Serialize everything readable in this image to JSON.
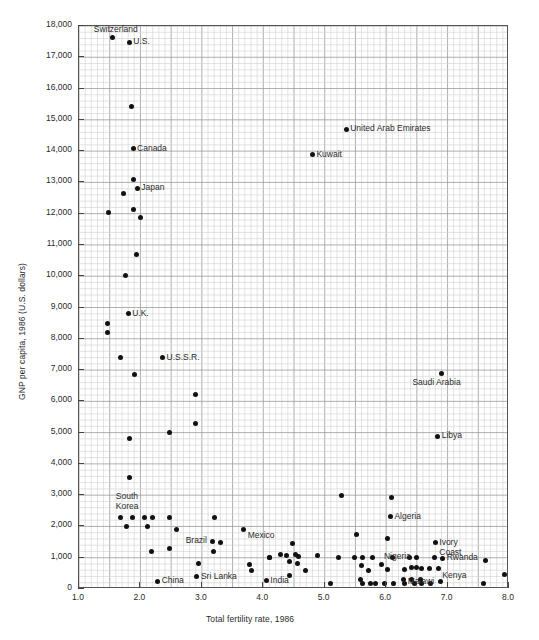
{
  "chart_data": {
    "type": "scatter",
    "title": "",
    "xlabel": "Total fertility rate, 1986",
    "ylabel": "GNP per capita, 1986 (U.S. dollars)",
    "xlim": [
      1.0,
      8.0
    ],
    "ylim": [
      0,
      18000
    ],
    "grid": true,
    "legend": "none",
    "xticks": [
      "1.0",
      "2.0",
      "3.0",
      "4.0",
      "5.0",
      "6.0",
      "7.0",
      "8.0"
    ],
    "xtick_values": [
      1.0,
      2.0,
      3.0,
      4.0,
      5.0,
      6.0,
      7.0,
      8.0
    ],
    "yticks": [
      "0",
      "1,000",
      "2,000",
      "3,000",
      "4,000",
      "5,000",
      "6,000",
      "7,000",
      "8,000",
      "9,000",
      "10,000",
      "11,000",
      "12,000",
      "13,000",
      "14,000",
      "15,000",
      "16,000",
      "17,000",
      "18,000"
    ],
    "ytick_values": [
      0,
      1000,
      2000,
      3000,
      4000,
      5000,
      6000,
      7000,
      8000,
      9000,
      10000,
      11000,
      12000,
      13000,
      14000,
      15000,
      16000,
      17000,
      18000
    ],
    "points": [
      {
        "x": 1.55,
        "y": 17620,
        "label": "Switzerland",
        "label_pos": "above-left"
      },
      {
        "x": 1.82,
        "y": 17480,
        "label": "U.S.",
        "label_pos": "right"
      },
      {
        "x": 1.86,
        "y": 15420,
        "label": "",
        "label_pos": ""
      },
      {
        "x": 1.88,
        "y": 14080,
        "label": "Canada",
        "label_pos": "right"
      },
      {
        "x": 1.88,
        "y": 13100,
        "label": "",
        "label_pos": ""
      },
      {
        "x": 1.73,
        "y": 12640,
        "label": "",
        "label_pos": ""
      },
      {
        "x": 1.95,
        "y": 12810,
        "label": "Japan",
        "label_pos": "right"
      },
      {
        "x": 1.88,
        "y": 12130,
        "label": "",
        "label_pos": ""
      },
      {
        "x": 1.48,
        "y": 12030,
        "label": "",
        "label_pos": ""
      },
      {
        "x": 2.0,
        "y": 11880,
        "label": "",
        "label_pos": ""
      },
      {
        "x": 1.93,
        "y": 10680,
        "label": "",
        "label_pos": ""
      },
      {
        "x": 1.75,
        "y": 10020,
        "label": "",
        "label_pos": ""
      },
      {
        "x": 1.8,
        "y": 8800,
        "label": "U.K.",
        "label_pos": "right"
      },
      {
        "x": 1.46,
        "y": 8490,
        "label": "",
        "label_pos": ""
      },
      {
        "x": 1.46,
        "y": 8200,
        "label": "",
        "label_pos": ""
      },
      {
        "x": 1.68,
        "y": 7390,
        "label": "",
        "label_pos": ""
      },
      {
        "x": 2.36,
        "y": 7390,
        "label": "U.S.S.R.",
        "label_pos": "right"
      },
      {
        "x": 1.9,
        "y": 6870,
        "label": "",
        "label_pos": ""
      },
      {
        "x": 2.9,
        "y": 6220,
        "label": "",
        "label_pos": ""
      },
      {
        "x": 2.9,
        "y": 5280,
        "label": "",
        "label_pos": ""
      },
      {
        "x": 2.48,
        "y": 5010,
        "label": "",
        "label_pos": ""
      },
      {
        "x": 1.82,
        "y": 4800,
        "label": "",
        "label_pos": ""
      },
      {
        "x": 6.9,
        "y": 6900,
        "label": "Saudi Arabia",
        "label_pos": "below"
      },
      {
        "x": 6.84,
        "y": 4880,
        "label": "Libya",
        "label_pos": "right"
      },
      {
        "x": 5.35,
        "y": 14700,
        "label": "United Arab Emirates",
        "label_pos": "right"
      },
      {
        "x": 4.8,
        "y": 13880,
        "label": "Kuwait",
        "label_pos": "right"
      },
      {
        "x": 1.83,
        "y": 3580,
        "label": "",
        "label_pos": ""
      },
      {
        "x": 5.28,
        "y": 2990,
        "label": "",
        "label_pos": ""
      },
      {
        "x": 6.08,
        "y": 2930,
        "label": "",
        "label_pos": ""
      },
      {
        "x": 6.07,
        "y": 2310,
        "label": "Algeria",
        "label_pos": "right"
      },
      {
        "x": 1.68,
        "y": 2290,
        "label": "South Korea",
        "label_pos": "above"
      },
      {
        "x": 1.87,
        "y": 2290,
        "label": "",
        "label_pos": ""
      },
      {
        "x": 2.07,
        "y": 2290,
        "label": "",
        "label_pos": ""
      },
      {
        "x": 2.2,
        "y": 2290,
        "label": "",
        "label_pos": ""
      },
      {
        "x": 2.48,
        "y": 2290,
        "label": "",
        "label_pos": ""
      },
      {
        "x": 3.2,
        "y": 2290,
        "label": "",
        "label_pos": ""
      },
      {
        "x": 1.78,
        "y": 2010,
        "label": "",
        "label_pos": ""
      },
      {
        "x": 2.12,
        "y": 2010,
        "label": "",
        "label_pos": ""
      },
      {
        "x": 3.68,
        "y": 1910,
        "label": "Mexico",
        "label_pos": "below-right"
      },
      {
        "x": 2.59,
        "y": 1890,
        "label": "",
        "label_pos": ""
      },
      {
        "x": 5.52,
        "y": 1750,
        "label": "",
        "label_pos": ""
      },
      {
        "x": 3.3,
        "y": 1490,
        "label": "",
        "label_pos": ""
      },
      {
        "x": 3.18,
        "y": 1530,
        "label": "Brazil",
        "label_pos": "left"
      },
      {
        "x": 2.48,
        "y": 1300,
        "label": "",
        "label_pos": ""
      },
      {
        "x": 2.18,
        "y": 1210,
        "label": "",
        "label_pos": ""
      },
      {
        "x": 3.19,
        "y": 1210,
        "label": "",
        "label_pos": ""
      },
      {
        "x": 4.1,
        "y": 1010,
        "label": "",
        "label_pos": ""
      },
      {
        "x": 3.78,
        "y": 790,
        "label": "",
        "label_pos": ""
      },
      {
        "x": 2.95,
        "y": 800,
        "label": "",
        "label_pos": ""
      },
      {
        "x": 3.8,
        "y": 600,
        "label": "",
        "label_pos": ""
      },
      {
        "x": 2.92,
        "y": 390,
        "label": "Sri Lanka",
        "label_pos": "right"
      },
      {
        "x": 2.28,
        "y": 240,
        "label": "China",
        "label_pos": "right"
      },
      {
        "x": 6.02,
        "y": 1610,
        "label": "",
        "label_pos": ""
      },
      {
        "x": 4.48,
        "y": 1440,
        "label": "",
        "label_pos": ""
      },
      {
        "x": 6.8,
        "y": 1480,
        "label": "Ivory Coast",
        "label_pos": "right"
      },
      {
        "x": 4.28,
        "y": 1090,
        "label": "",
        "label_pos": ""
      },
      {
        "x": 4.38,
        "y": 1080,
        "label": "",
        "label_pos": ""
      },
      {
        "x": 4.52,
        "y": 1090,
        "label": "",
        "label_pos": ""
      },
      {
        "x": 4.58,
        "y": 1040,
        "label": "",
        "label_pos": ""
      },
      {
        "x": 4.1,
        "y": 1010,
        "label": "",
        "label_pos": ""
      },
      {
        "x": 4.42,
        "y": 880,
        "label": "",
        "label_pos": ""
      },
      {
        "x": 4.55,
        "y": 830,
        "label": "",
        "label_pos": ""
      },
      {
        "x": 4.88,
        "y": 1060,
        "label": "",
        "label_pos": ""
      },
      {
        "x": 5.22,
        "y": 1010,
        "label": "",
        "label_pos": ""
      },
      {
        "x": 5.62,
        "y": 1000,
        "label": "",
        "label_pos": ""
      },
      {
        "x": 5.78,
        "y": 1010,
        "label": "",
        "label_pos": ""
      },
      {
        "x": 6.1,
        "y": 1020,
        "label": "",
        "label_pos": ""
      },
      {
        "x": 6.38,
        "y": 1010,
        "label": "",
        "label_pos": ""
      },
      {
        "x": 6.5,
        "y": 1010,
        "label": "Nigeria",
        "label_pos": "left"
      },
      {
        "x": 6.78,
        "y": 1010,
        "label": "",
        "label_pos": ""
      },
      {
        "x": 6.92,
        "y": 990,
        "label": "Rwanda",
        "label_pos": "right"
      },
      {
        "x": 7.62,
        "y": 900,
        "label": "",
        "label_pos": ""
      },
      {
        "x": 4.68,
        "y": 600,
        "label": "",
        "label_pos": ""
      },
      {
        "x": 5.6,
        "y": 760,
        "label": "",
        "label_pos": ""
      },
      {
        "x": 5.72,
        "y": 600,
        "label": "",
        "label_pos": ""
      },
      {
        "x": 5.92,
        "y": 790,
        "label": "",
        "label_pos": ""
      },
      {
        "x": 6.02,
        "y": 620,
        "label": "",
        "label_pos": ""
      },
      {
        "x": 6.3,
        "y": 620,
        "label": "",
        "label_pos": ""
      },
      {
        "x": 6.42,
        "y": 680,
        "label": "",
        "label_pos": ""
      },
      {
        "x": 6.5,
        "y": 700,
        "label": "",
        "label_pos": ""
      },
      {
        "x": 6.58,
        "y": 670,
        "label": "",
        "label_pos": ""
      },
      {
        "x": 6.7,
        "y": 650,
        "label": "",
        "label_pos": ""
      },
      {
        "x": 6.85,
        "y": 640,
        "label": "Kenya",
        "label_pos": "below-right"
      },
      {
        "x": 4.42,
        "y": 420,
        "label": "",
        "label_pos": ""
      },
      {
        "x": 4.05,
        "y": 260,
        "label": "India",
        "label_pos": "right"
      },
      {
        "x": 5.58,
        "y": 300,
        "label": "",
        "label_pos": ""
      },
      {
        "x": 5.62,
        "y": 170,
        "label": "",
        "label_pos": ""
      },
      {
        "x": 5.74,
        "y": 170,
        "label": "",
        "label_pos": ""
      },
      {
        "x": 5.82,
        "y": 170,
        "label": "",
        "label_pos": ""
      },
      {
        "x": 5.98,
        "y": 160,
        "label": "",
        "label_pos": ""
      },
      {
        "x": 6.12,
        "y": 170,
        "label": "",
        "label_pos": ""
      },
      {
        "x": 6.28,
        "y": 300,
        "label": "",
        "label_pos": ""
      },
      {
        "x": 6.3,
        "y": 160,
        "label": "",
        "label_pos": ""
      },
      {
        "x": 6.42,
        "y": 300,
        "label": "",
        "label_pos": ""
      },
      {
        "x": 6.46,
        "y": 180,
        "label": "",
        "label_pos": ""
      },
      {
        "x": 6.56,
        "y": 300,
        "label": "",
        "label_pos": ""
      },
      {
        "x": 6.58,
        "y": 170,
        "label": "",
        "label_pos": ""
      },
      {
        "x": 6.72,
        "y": 170,
        "label": "",
        "label_pos": ""
      },
      {
        "x": 6.88,
        "y": 230,
        "label": "Malawi",
        "label_pos": "left"
      },
      {
        "x": 7.58,
        "y": 190,
        "label": "",
        "label_pos": ""
      },
      {
        "x": 7.92,
        "y": 450,
        "label": "",
        "label_pos": ""
      },
      {
        "x": 5.1,
        "y": 170,
        "label": "",
        "label_pos": ""
      },
      {
        "x": 5.48,
        "y": 1010,
        "label": "",
        "label_pos": ""
      }
    ]
  },
  "figure": {
    "caption": ""
  }
}
